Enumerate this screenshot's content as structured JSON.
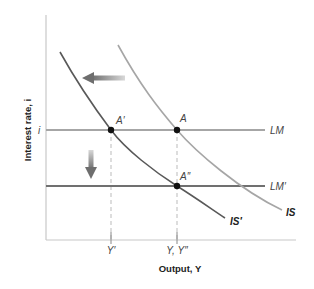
{
  "diagram": {
    "type": "IS-LM diagram",
    "axes": {
      "x_title": "Output, Y",
      "y_title": "Interest rate, i"
    },
    "ticks": {
      "y_tick_i": "i",
      "x_tick_y_prime": "Y′",
      "x_tick_y_y_double_prime": "Y, Y″"
    },
    "curves": {
      "is": {
        "label": "IS",
        "color": "#a6a6a6"
      },
      "is_prime": {
        "label": "IS′",
        "color": "#595959"
      },
      "lm": {
        "label": "LM",
        "color": "#a6a6a6"
      },
      "lm_prime": {
        "label": "LM′",
        "color": "#707070"
      }
    },
    "points": {
      "a": {
        "label": "A"
      },
      "a_prime": {
        "label": "A′"
      },
      "a_double_prime": {
        "label": "A″"
      }
    },
    "arrows": {
      "is_shift": {
        "direction": "left"
      },
      "lm_shift": {
        "direction": "down"
      }
    },
    "colors": {
      "axis": "#c8c8c8",
      "dashed": "#bbbbbb",
      "point": "#111111",
      "arrow": "#808080"
    }
  }
}
